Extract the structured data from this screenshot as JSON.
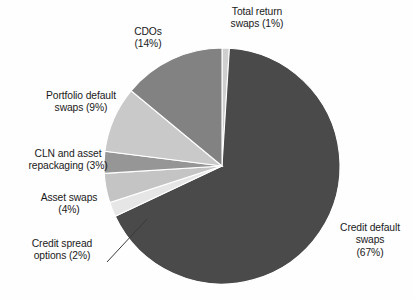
{
  "chart_data": {
    "type": "pie",
    "title": "",
    "subtitle": "",
    "xlabel": "",
    "ylabel": "",
    "grid": false,
    "legend_position": "none",
    "label_format": "name (percent%)",
    "total_percent": 100,
    "start_angle_deg": 0,
    "direction": "clockwise",
    "categories": [
      "Total return swaps",
      "Credit default swaps",
      "Credit spread options",
      "Asset swaps",
      "CLN and asset repackaging",
      "Portfolio default swaps",
      "CDOs"
    ],
    "values": [
      1,
      67,
      2,
      4,
      3,
      9,
      14
    ],
    "slices": [
      {
        "name": "Total return swaps",
        "percent": 1,
        "label": "Total return\nswaps (1%)",
        "color": "#cfcfcf",
        "start_deg": 0,
        "end_deg": 3.6
      },
      {
        "name": "Credit default swaps",
        "percent": 67,
        "label": "Credit default\nswaps\n(67%)",
        "color": "#4a4a4a",
        "start_deg": 3.6,
        "end_deg": 244.8
      },
      {
        "name": "Credit spread options",
        "percent": 2,
        "label": "Credit spread\noptions (2%)",
        "color": "#e6e6e6",
        "start_deg": 244.8,
        "end_deg": 252.0,
        "has_leader_line": true
      },
      {
        "name": "Asset swaps",
        "percent": 4,
        "label": "Asset swaps\n(4%)",
        "color": "#c4c4c4",
        "start_deg": 252.0,
        "end_deg": 266.4
      },
      {
        "name": "CLN and asset repackaging",
        "percent": 3,
        "label": "CLN and asset\nrepackaging (3%)",
        "color": "#969696",
        "start_deg": 266.4,
        "end_deg": 277.2
      },
      {
        "name": "Portfolio default swaps",
        "percent": 9,
        "label": "Portfolio default\nswaps (9%)",
        "color": "#c9c9c9",
        "start_deg": 277.2,
        "end_deg": 309.6
      },
      {
        "name": "CDOs",
        "percent": 14,
        "label": "CDOs\n(14%)",
        "color": "#828282",
        "start_deg": 309.6,
        "end_deg": 360.0
      }
    ],
    "geometry": {
      "center_x": 222,
      "center_y": 166,
      "radius": 118,
      "stroke_color": "#ffffff",
      "stroke_width": 1.1
    },
    "leader_line": {
      "from_x": 107,
      "from_y": 262,
      "to_x": 147,
      "to_y": 219,
      "color": "#3a3a3a"
    }
  }
}
